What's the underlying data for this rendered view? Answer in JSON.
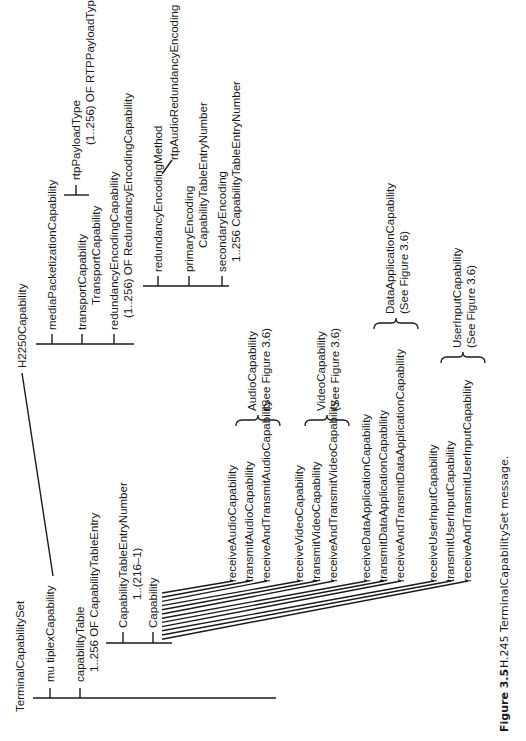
{
  "figure": {
    "number": "Figure 3.5",
    "caption": "H.245 TerminalCapabilitySet message."
  },
  "nodes": {
    "root": "TerminalCapabilitySet",
    "multiplex": "mu tiplexCapability",
    "capabilityTable": "capabilityTable",
    "capabilityTableSub": "1..256 OF CapabilityTableEntry",
    "entryNumber": "CapabilityTableEntryNumber",
    "entryNumberSub": "1..(216–1)",
    "capability": "Capability",
    "h2250": "H2250Capability",
    "mediaPacketization": "mediaPacketizationCapability",
    "transport": "transportCapability",
    "transportSub": "TransportCapability",
    "redundancy": "redundancyEncodingCapability",
    "redundancySub": "(1..256) OF RedundancyEncodingCapability",
    "rtpPayloadType": "rtpPayloadType",
    "rtpPayloadTypeSub": "(1..256) OF RTPPayloadType",
    "redundancyMethod": "redundancyEncodingMethod",
    "rtpAudioRedundancy": "rtpAudioRedundancyEncoding",
    "primaryEncoding": "primaryEncoding",
    "primaryEncodingSub": "CapabilityTableEntryNumber",
    "secondaryEncoding": "secondaryEncoding",
    "secondaryEncodingSub": "1..256 CapabilityTableEntryNumber"
  },
  "capabilities": [
    "receiveAudioCapability",
    "transmitAudioCapability",
    "receiveAndTransmitAudioCapability",
    "receiveVideoCapability",
    "transmitVideoCapability",
    "receiveAndTransmitVideoCapability",
    "receiveDataApplicationCapability",
    "transmitDataApplicationCapability",
    "receiveAndTransmitDataApplicationCapability",
    "receiveUserInputCapability",
    "transmitUserInputCapability",
    "receiveAndTransmitUserInputCapability"
  ],
  "groups": [
    {
      "name": "AudioCapability",
      "ref": "(See Figure 3.6)"
    },
    {
      "name": "VideoCapability",
      "ref": "(See Figure 3.6)"
    },
    {
      "name": "DataApplicationCapability",
      "ref": "(See Figure 3.6)"
    },
    {
      "name": "UserInputCapability",
      "ref": "(See Figure 3.6)"
    }
  ]
}
